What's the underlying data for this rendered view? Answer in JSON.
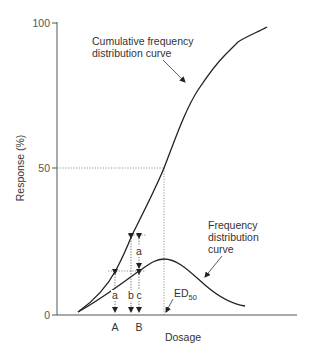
{
  "diagram": {
    "type": "dose-response curves",
    "y_axis": {
      "label": "Response (%)",
      "ticks": [
        "100",
        "50",
        "0"
      ]
    },
    "x_axis": {
      "label": "Dosage",
      "markers": [
        "A",
        "B"
      ]
    },
    "curves": {
      "cumulative": {
        "label_line1": "Cumulative frequency",
        "label_line2": "distribution curve"
      },
      "frequency": {
        "label_line1": "Frequency",
        "label_line2": "distribution",
        "label_line3": "curve"
      }
    },
    "annotations": {
      "ed": "ED",
      "ed_sub": "50",
      "a_upper": "a",
      "a_lower": "a",
      "b": "b",
      "c": "c"
    }
  }
}
